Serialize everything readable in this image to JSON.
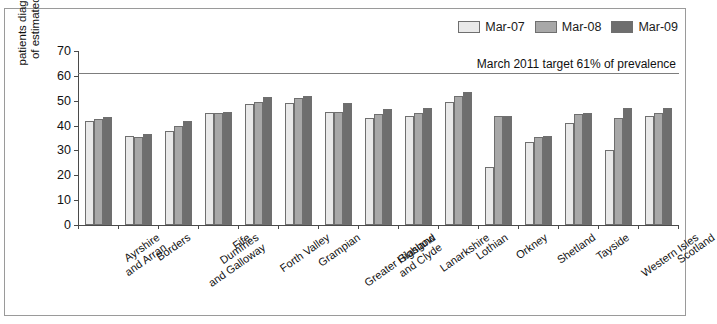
{
  "chart_data": {
    "type": "bar",
    "title": "",
    "xlabel": "",
    "ylabel": "patients diagnosed as a %\nof estimated prevalence",
    "ylim": [
      0,
      70
    ],
    "yticks": [
      0,
      10,
      20,
      30,
      40,
      50,
      60,
      70
    ],
    "grid": false,
    "legend_position": "top-right",
    "categories": [
      "Ayrshire\nand Arran",
      "Borders",
      "Dumfries\nand Galloway",
      "Fife",
      "Forth Valley",
      "Grampian",
      "Greater Glasgow\nand Clyde",
      "Highland",
      "Lanarkshire",
      "Lothian",
      "Orkney",
      "Shetland",
      "Tayside",
      "Western Isles",
      "Scotland"
    ],
    "series": [
      {
        "name": "Mar-07",
        "color": "#e9e9e9",
        "values": [
          42.0,
          36.0,
          38.0,
          45.0,
          48.5,
          49.0,
          45.5,
          43.0,
          44.0,
          49.5,
          23.5,
          33.5,
          41.0,
          30.0,
          44.0
        ]
      },
      {
        "name": "Mar-08",
        "color": "#a8a8a8",
        "values": [
          42.5,
          35.5,
          40.0,
          45.0,
          49.5,
          51.0,
          45.5,
          44.5,
          45.0,
          52.0,
          44.0,
          35.5,
          44.5,
          43.0,
          45.0
        ]
      },
      {
        "name": "Mar-09",
        "color": "#6e6e6e",
        "values": [
          43.5,
          36.5,
          42.0,
          45.5,
          51.5,
          52.0,
          49.0,
          46.5,
          47.0,
          53.5,
          44.0,
          36.0,
          45.0,
          47.0,
          47.0
        ]
      }
    ],
    "annotations": [
      {
        "name": "march-2011-target",
        "label": "March 2011 target 61% of prevalence",
        "value": 61,
        "color": "#7d7d7d"
      }
    ]
  }
}
